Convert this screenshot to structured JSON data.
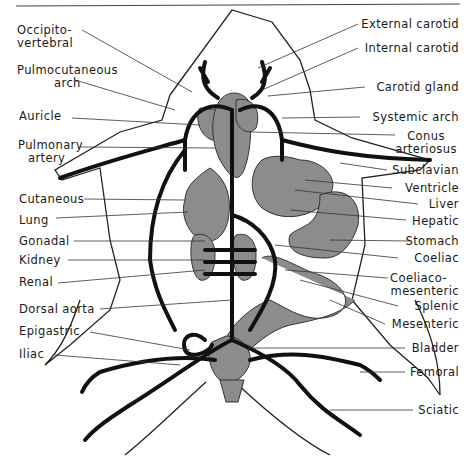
{
  "figure": {
    "colors": {
      "vessel": "#111111",
      "organ_fill": "#8c8c8c",
      "outline": "#222222",
      "leader": "#333333",
      "background": "#ffffff"
    }
  },
  "labels_left": [
    {
      "id": "occipito-vertebral",
      "lines": [
        "Occipito-",
        "vertebral"
      ]
    },
    {
      "id": "pulmocutaneous-arch",
      "lines": [
        "Pulmocutaneous",
        "arch"
      ]
    },
    {
      "id": "auricle",
      "lines": [
        "Auricle"
      ]
    },
    {
      "id": "pulmonary-artery",
      "lines": [
        "Pulmonary",
        "artery"
      ]
    },
    {
      "id": "cutaneous",
      "lines": [
        "Cutaneous"
      ]
    },
    {
      "id": "lung",
      "lines": [
        "Lung"
      ]
    },
    {
      "id": "gonadal",
      "lines": [
        "Gonadal"
      ]
    },
    {
      "id": "kidney",
      "lines": [
        "Kidney"
      ]
    },
    {
      "id": "renal",
      "lines": [
        "Renal"
      ]
    },
    {
      "id": "dorsal-aorta",
      "lines": [
        "Dorsal aorta"
      ]
    },
    {
      "id": "epigastric",
      "lines": [
        "Epigastric"
      ]
    },
    {
      "id": "iliac",
      "lines": [
        "Iliac"
      ]
    }
  ],
  "labels_right": [
    {
      "id": "external-carotid",
      "lines": [
        "External carotid"
      ]
    },
    {
      "id": "internal-carotid",
      "lines": [
        "Internal carotid"
      ]
    },
    {
      "id": "carotid-gland",
      "lines": [
        "Carotid gland"
      ]
    },
    {
      "id": "systemic-arch",
      "lines": [
        "Systemic arch"
      ]
    },
    {
      "id": "conus-arteriosus",
      "lines": [
        "Conus",
        "arteriosus"
      ]
    },
    {
      "id": "subclavian",
      "lines": [
        "Subclavian"
      ]
    },
    {
      "id": "ventricle",
      "lines": [
        "Ventricle"
      ]
    },
    {
      "id": "liver",
      "lines": [
        "Liver"
      ]
    },
    {
      "id": "hepatic",
      "lines": [
        "Hepatic"
      ]
    },
    {
      "id": "stomach",
      "lines": [
        "Stomach"
      ]
    },
    {
      "id": "coeliac",
      "lines": [
        "Coeliac"
      ]
    },
    {
      "id": "coeliaco-mesenteric",
      "lines": [
        "Coeliaco-",
        "mesenteric"
      ]
    },
    {
      "id": "splenic",
      "lines": [
        "Splenic"
      ]
    },
    {
      "id": "mesenteric",
      "lines": [
        "Mesenteric"
      ]
    },
    {
      "id": "bladder",
      "lines": [
        "Bladder"
      ]
    },
    {
      "id": "femoral",
      "lines": [
        "Femoral"
      ]
    },
    {
      "id": "sciatic",
      "lines": [
        "Sciatic"
      ]
    }
  ]
}
